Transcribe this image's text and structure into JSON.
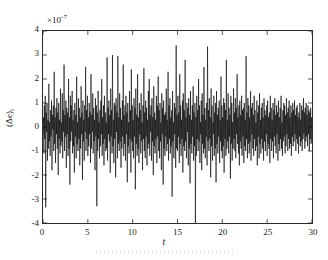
{
  "figure": {
    "background_color": "#ffffff",
    "axis_color": "#2b2b2b",
    "trace_color": "#000000"
  },
  "axes": {
    "exponent_prefix": "×10",
    "exponent_value": "-7",
    "xlabel": "t",
    "ylabel_main": "(Δe)",
    "ylabel_sub": "i",
    "xticks": [
      "0",
      "5",
      "10",
      "15",
      "20",
      "25",
      "30"
    ],
    "yticks": [
      "4",
      "3",
      "2",
      "1",
      "0",
      "-1",
      "-2",
      "-3",
      "-4"
    ]
  },
  "chart_data": {
    "type": "line",
    "title": "",
    "subtitle": "",
    "xlabel": "t",
    "ylabel": "(Δe)_i",
    "y_exponent": -7,
    "y_unit_multiplier": "1e-7",
    "xlim": [
      0,
      30
    ],
    "ylim": [
      -4,
      4
    ],
    "xticks": [
      0,
      5,
      10,
      15,
      20,
      25,
      30
    ],
    "yticks": [
      -4,
      -3,
      -2,
      -1,
      0,
      1,
      2,
      3,
      4
    ],
    "grid": false,
    "legend": null,
    "legend_position": "none",
    "box": true,
    "tick_direction": "in",
    "series": [
      {
        "name": "(Δe)_i",
        "color": "#000000",
        "linewidth": 0.6,
        "description": "Zero-mean high-frequency random error signal; dense noise band mostly within ±1.5e-7 with intermittent spikes reaching ±3.4e-7 and one downward excursion to -4e-7 near t=22.6",
        "n_points": 601,
        "x_start": 0,
        "x_end": 30,
        "x_step": 0.05,
        "stats": {
          "mean": 0.0,
          "std": 0.9,
          "min": -4.0,
          "max": 3.4,
          "units": "1e-7"
        },
        "values": [
          -0.3,
          0.4,
          -1.1,
          0.9,
          -0.5,
          1.3,
          -3.35,
          0.6,
          -0.2,
          1.0,
          -1.4,
          0.3,
          -0.9,
          1.8,
          -0.6,
          0.2,
          -1.2,
          0.7,
          -0.4,
          1.1,
          -1.8,
          0.5,
          -0.1,
          0.9,
          -1.0,
          2.3,
          -0.7,
          0.4,
          -1.5,
          0.8,
          -0.3,
          1.2,
          -0.9,
          0.6,
          -2.0,
          1.0,
          -0.5,
          0.3,
          -1.1,
          1.6,
          -0.8,
          0.2,
          -0.6,
          1.4,
          -1.3,
          0.7,
          -0.2,
          2.6,
          -1.0,
          0.5,
          -0.4,
          1.1,
          -1.7,
          0.8,
          -0.3,
          0.6,
          -1.2,
          2.0,
          -0.9,
          0.4,
          -2.4,
          1.3,
          -0.6,
          0.9,
          -0.2,
          1.5,
          -1.1,
          0.3,
          -0.8,
          0.7,
          -1.9,
          1.0,
          -0.4,
          0.5,
          -1.3,
          2.1,
          -0.7,
          0.2,
          -1.0,
          1.2,
          -0.5,
          0.8,
          -1.6,
          0.4,
          -0.9,
          1.7,
          -0.3,
          0.6,
          -2.2,
          1.1,
          -0.6,
          0.3,
          -1.4,
          0.9,
          -0.2,
          2.5,
          -1.0,
          0.7,
          -0.5,
          1.3,
          -1.2,
          0.4,
          -0.8,
          1.0,
          -0.3,
          0.6,
          -1.5,
          2.2,
          -0.9,
          0.5,
          -0.2,
          1.4,
          -1.1,
          0.8,
          -0.6,
          0.3,
          -1.8,
          1.2,
          -0.4,
          0.9,
          -3.3,
          0.6,
          -1.0,
          1.5,
          -0.5,
          0.2,
          -1.3,
          0.7,
          -0.8,
          1.1,
          -0.3,
          2.0,
          -1.2,
          0.4,
          -0.7,
          0.9,
          -1.6,
          1.3,
          -0.5,
          0.6,
          -1.0,
          0.2,
          -0.9,
          2.9,
          -1.4,
          0.8,
          -0.3,
          1.1,
          -0.6,
          0.5,
          -1.9,
          1.6,
          -0.4,
          0.7,
          -1.1,
          3.0,
          -0.8,
          0.3,
          -1.5,
          1.0,
          -0.5,
          0.9,
          -2.1,
          1.2,
          -0.2,
          0.6,
          -1.3,
          2.95,
          -0.7,
          0.4,
          -1.0,
          1.4,
          -0.6,
          0.8,
          -1.7,
          0.3,
          -0.9,
          1.1,
          -0.4,
          2.6,
          -1.2,
          0.5,
          -0.7,
          0.9,
          -1.4,
          1.3,
          -0.3,
          0.6,
          -2.3,
          1.0,
          -0.8,
          0.2,
          -1.1,
          1.5,
          -0.5,
          0.7,
          -1.9,
          2.4,
          -0.6,
          0.9,
          -1.0,
          0.3,
          -1.3,
          1.2,
          -0.4,
          0.8,
          -2.6,
          1.6,
          -0.7,
          0.5,
          -1.2,
          2.2,
          -0.9,
          0.4,
          -1.5,
          1.0,
          -0.3,
          0.7,
          -1.1,
          1.4,
          -0.6,
          0.2,
          -1.8,
          0.9,
          -0.5,
          2.45,
          -1.0,
          0.6,
          -1.3,
          1.1,
          -0.4,
          0.8,
          -1.6,
          0.3,
          -0.9,
          1.5,
          -0.7,
          2.0,
          -1.2,
          0.5,
          -0.2,
          0.9,
          -1.4,
          1.2,
          -0.6,
          0.4,
          -2.0,
          1.7,
          -0.8,
          0.6,
          -1.1,
          0.3,
          -0.5,
          1.3,
          -1.5,
          0.9,
          -0.4,
          2.1,
          -1.0,
          0.7,
          -1.3,
          1.0,
          -0.6,
          0.2,
          -1.8,
          1.4,
          -0.3,
          0.8,
          -2.4,
          1.1,
          -0.9,
          0.5,
          -1.2,
          0.6,
          -0.4,
          1.6,
          -1.0,
          0.3,
          -0.7,
          2.3,
          -1.4,
          0.9,
          -0.5,
          1.2,
          -1.1,
          0.4,
          -0.8,
          0.7,
          -2.9,
          1.5,
          -0.6,
          0.2,
          -1.3,
          1.0,
          -0.3,
          0.8,
          -1.7,
          3.4,
          -0.9,
          0.5,
          -1.0,
          1.3,
          -0.4,
          0.6,
          -1.5,
          2.2,
          -0.7,
          0.9,
          -1.2,
          0.3,
          -0.5,
          1.1,
          -1.9,
          1.4,
          -0.8,
          0.7,
          -1.0,
          2.8,
          -0.6,
          0.4,
          -1.3,
          1.0,
          -0.2,
          0.8,
          -1.6,
          1.2,
          -0.9,
          0.5,
          -2.35,
          1.5,
          -0.7,
          0.3,
          -1.1,
          0.9,
          -0.4,
          1.7,
          -1.4,
          0.6,
          -0.8,
          1.0,
          -4.0,
          0.4,
          -1.2,
          1.3,
          -0.5,
          0.7,
          -1.0,
          2.0,
          -0.6,
          0.9,
          -1.5,
          0.2,
          -0.3,
          1.1,
          -1.8,
          1.4,
          -0.7,
          0.5,
          -1.1,
          2.5,
          -0.9,
          0.8,
          -1.3,
          0.3,
          -0.4,
          1.0,
          -1.6,
          3.35,
          -0.6,
          0.7,
          -1.0,
          1.2,
          -0.5,
          0.4,
          -2.1,
          1.6,
          -0.8,
          0.9,
          -1.4,
          0.2,
          -0.3,
          1.3,
          -1.2,
          0.6,
          -0.9,
          1.0,
          -2.3,
          1.5,
          -0.7,
          0.5,
          -1.1,
          0.8,
          -0.4,
          1.1,
          -1.5,
          0.3,
          -0.6,
          2.1,
          -1.0,
          0.9,
          -1.3,
          0.4,
          -0.8,
          1.2,
          -1.9,
          1.0,
          -0.5,
          0.7,
          -1.2,
          2.8,
          -0.9,
          0.3,
          -0.6,
          1.4,
          -1.1,
          0.8,
          -0.4,
          0.5,
          -2.15,
          1.3,
          -0.7,
          1.0,
          -1.4,
          0.2,
          -0.9,
          1.6,
          -0.5,
          0.6,
          -1.0,
          1.2,
          -1.3,
          0.8,
          -0.3,
          2.2,
          -0.7,
          0.4,
          -1.1,
          0.9,
          -1.6,
          1.1,
          -0.6,
          0.5,
          -0.9,
          1.3,
          -1.2,
          0.7,
          -0.4,
          0.8,
          -1.5,
          1.0,
          -0.8,
          0.3,
          -1.0,
          2.95,
          -0.5,
          0.6,
          -1.3,
          1.2,
          -0.7,
          0.9,
          -1.1,
          0.4,
          -0.6,
          1.5,
          -1.4,
          0.8,
          -0.3,
          1.0,
          -0.9,
          0.5,
          -1.2,
          1.3,
          -0.5,
          0.7,
          -1.0,
          0.2,
          -0.8,
          1.1,
          -1.6,
          0.6,
          -0.4,
          0.9,
          -1.3,
          1.4,
          -0.7,
          0.3,
          -1.1,
          0.8,
          -0.5,
          1.0,
          -0.9,
          0.4,
          -1.4,
          1.2,
          -0.6,
          0.7,
          -1.0,
          0.5,
          -0.3,
          0.9,
          -1.2,
          1.1,
          -0.7,
          0.4,
          -0.9,
          0.6,
          -1.5,
          1.3,
          -0.5,
          0.8,
          -1.0,
          0.3,
          -0.6,
          1.0,
          -1.3,
          0.7,
          -0.4,
          1.2,
          -0.8,
          0.5,
          -1.1,
          0.9,
          -0.3,
          0.6,
          -1.4,
          1.1,
          -0.7,
          0.4,
          -1.0,
          0.8,
          -0.5,
          1.3,
          -0.9,
          0.2,
          -1.2,
          0.7,
          -0.6,
          1.0,
          -0.4,
          0.9,
          -1.1,
          0.5,
          -0.8,
          1.2,
          -0.3,
          0.6,
          -1.0,
          0.8,
          -0.5,
          1.1,
          -0.9,
          0.4,
          -0.7,
          0.9,
          -1.2,
          0.6,
          -0.4,
          1.0,
          -0.8,
          0.7,
          -0.6,
          1.1,
          -0.3,
          0.5,
          -1.0,
          0.8,
          -0.5,
          0.9,
          -0.7,
          0.4,
          -1.1,
          0.6,
          -0.4,
          1.0,
          -0.8,
          0.3,
          -0.6,
          0.9,
          -1.0,
          0.7,
          -0.5,
          1.2,
          -0.3,
          0.6,
          -0.9,
          0.8,
          -0.6,
          1.0,
          -0.4,
          0.5,
          -0.8,
          0.9,
          -0.3,
          0.7,
          -1.0,
          0.6,
          -0.5,
          0.8,
          -0.7,
          0.4,
          -0.6
        ]
      }
    ]
  }
}
